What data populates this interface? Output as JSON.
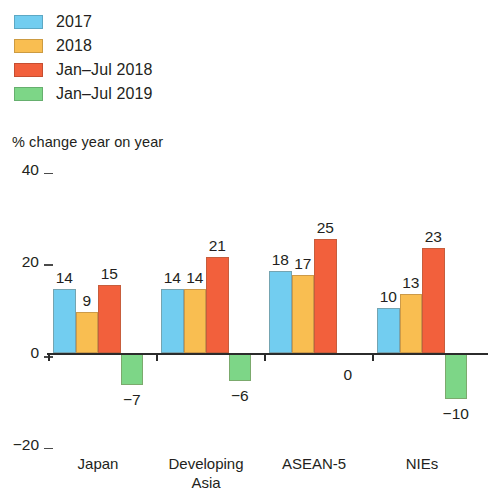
{
  "chart_data": {
    "type": "bar",
    "title": "",
    "subtitle": "",
    "xlabel": "",
    "ylabel": "% change year on year",
    "ylim": [
      -20,
      40
    ],
    "yticks": [
      40,
      20,
      0,
      -20
    ],
    "ytick_labels": [
      "40",
      "20",
      "0",
      "−20"
    ],
    "grid": false,
    "legend_position": "top-left",
    "categories": [
      "Japan",
      "Developing\nAsia",
      "ASEAN-5",
      "NIEs"
    ],
    "series": [
      {
        "name": "2017",
        "color": "#72CDF0",
        "values": [
          14,
          14,
          18,
          10
        ],
        "labels": [
          "14",
          "14",
          "18",
          "10"
        ]
      },
      {
        "name": "2018",
        "color": "#F9BE51",
        "values": [
          9,
          14,
          17,
          13
        ],
        "labels": [
          "9",
          "14",
          "17",
          "13"
        ]
      },
      {
        "name": "Jan–Jul 2018",
        "color": "#F2603C",
        "values": [
          15,
          21,
          25,
          23
        ],
        "labels": [
          "15",
          "21",
          "25",
          "23"
        ]
      },
      {
        "name": "Jan–Jul 2019",
        "color": "#7DD687",
        "values": [
          -7,
          -6,
          0,
          -10
        ],
        "labels": [
          "−7",
          "−6",
          "0",
          "−10"
        ]
      }
    ]
  },
  "legend": {
    "items": [
      {
        "label": "2017",
        "color": "#72CDF0"
      },
      {
        "label": "2018",
        "color": "#F9BE51"
      },
      {
        "label": "Jan–Jul 2018",
        "color": "#F2603C"
      },
      {
        "label": "Jan–Jul 2019",
        "color": "#7DD687"
      }
    ]
  },
  "axis": {
    "y_title": "% change year on year"
  }
}
